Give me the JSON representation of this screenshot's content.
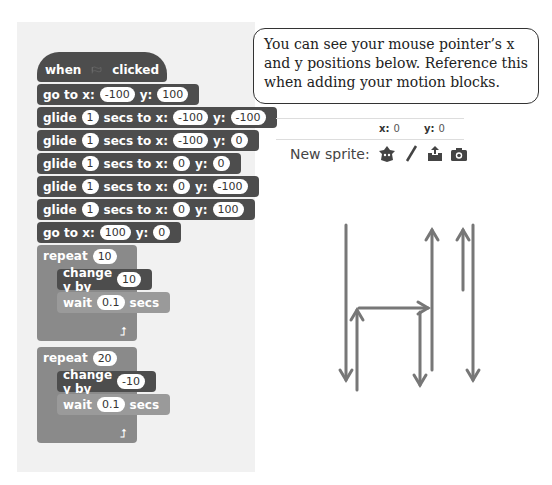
{
  "script": {
    "hat": {
      "when": "when",
      "clicked": "clicked",
      "icon": "green-flag-icon"
    },
    "blocks": [
      {
        "parts": [
          "go to x:",
          "-100",
          "y:",
          "100"
        ]
      },
      {
        "parts": [
          "glide",
          "1",
          "secs to x:",
          "-100",
          "y:",
          "-100"
        ]
      },
      {
        "parts": [
          "glide",
          "1",
          "secs to x:",
          "-100",
          "y:",
          "0"
        ]
      },
      {
        "parts": [
          "glide",
          "1",
          "secs to x:",
          "0",
          "y:",
          "0"
        ]
      },
      {
        "parts": [
          "glide",
          "1",
          "secs to x:",
          "0",
          "y:",
          "-100"
        ]
      },
      {
        "parts": [
          "glide",
          "1",
          "secs to x:",
          "0",
          "y:",
          "100"
        ]
      },
      {
        "parts": [
          "go to x:",
          "100",
          "y:",
          "0"
        ]
      }
    ],
    "repeat1": {
      "label": "repeat",
      "count": "10",
      "change_label": "change y by",
      "change_value": "10",
      "wait_label": "wait",
      "wait_value": "0.1",
      "secs": "secs"
    },
    "repeat2": {
      "label": "repeat",
      "count": "20",
      "change_label": "change y by",
      "change_value": "-10",
      "wait_label": "wait",
      "wait_value": "0.1",
      "secs": "secs"
    }
  },
  "callout": {
    "text": "You can see your mouse pointer’s x and y positions below. Reference this when adding your motion blocks."
  },
  "stage_info": {
    "x_label": "x:",
    "x_value": "0",
    "y_label": "y:",
    "y_value": "0"
  },
  "new_sprite": {
    "label": "New sprite:",
    "icons": [
      "sprite-library-icon",
      "paint-brush-icon",
      "upload-icon",
      "camera-icon"
    ]
  }
}
